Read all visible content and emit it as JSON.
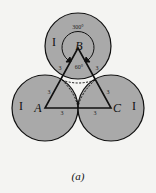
{
  "diagram": {
    "circles": [
      {
        "id": "B",
        "cx": 78,
        "cy": 46,
        "r": 33
      },
      {
        "id": "A",
        "cx": 45,
        "cy": 108,
        "r": 33
      },
      {
        "id": "C",
        "cx": 111,
        "cy": 108,
        "r": 33
      }
    ],
    "vertices": {
      "A": "A",
      "B": "B",
      "C": "C"
    },
    "region_labels": {
      "top": "I",
      "left": "I",
      "right": "I"
    },
    "side_labels": [
      "3",
      "3",
      "3",
      "3",
      "3",
      "3"
    ],
    "angles": {
      "outer": "300°",
      "inner": "60°"
    },
    "colors": {
      "fill": "#a9a9a9",
      "stroke": "#111111",
      "background": "#f4f4f2"
    }
  },
  "caption": "(a)"
}
